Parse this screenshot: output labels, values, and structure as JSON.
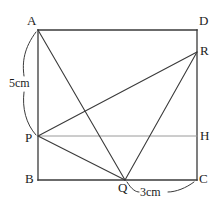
{
  "figure": {
    "type": "geometry-diagram",
    "stroke_color": "#3a3a3a",
    "light_stroke_color": "#9a9a9a",
    "background_color": "#ffffff",
    "canvas": {
      "width": 219,
      "height": 210
    },
    "vertices": [
      {
        "id": "A",
        "label": "A",
        "x": 38,
        "y": 30,
        "label_x": 27,
        "label_y": 14
      },
      {
        "id": "D",
        "label": "D",
        "x": 197,
        "y": 30,
        "label_x": 199,
        "label_y": 14
      },
      {
        "id": "R",
        "label": "R",
        "x": 197,
        "y": 52,
        "label_x": 200,
        "label_y": 44
      },
      {
        "id": "H",
        "label": "H",
        "x": 197,
        "y": 136,
        "label_x": 200,
        "label_y": 128
      },
      {
        "id": "P",
        "label": "P",
        "x": 38,
        "y": 136,
        "label_x": 25,
        "label_y": 136
      },
      {
        "id": "B",
        "label": "B",
        "x": 38,
        "y": 180,
        "label_x": 25,
        "label_y": 176
      },
      {
        "id": "Q",
        "label": "Q",
        "x": 125,
        "y": 180,
        "label_x": 118,
        "label_y": 182
      },
      {
        "id": "C",
        "label": "C",
        "x": 197,
        "y": 180,
        "label_x": 199,
        "label_y": 176
      }
    ],
    "rectangle_sides": [
      {
        "name": "side-AD",
        "from": "A",
        "to": "D"
      },
      {
        "name": "side-DC",
        "from": "D",
        "to": "C"
      },
      {
        "name": "side-CB",
        "from": "C",
        "to": "B"
      },
      {
        "name": "side-BA",
        "from": "B",
        "to": "A"
      }
    ],
    "segments": [
      {
        "name": "segment-AQ",
        "from": "A",
        "to": "Q",
        "style": "dark"
      },
      {
        "name": "segment-PR",
        "from": "P",
        "to": "R",
        "style": "dark"
      },
      {
        "name": "segment-PQ",
        "from": "P",
        "to": "Q",
        "style": "dark"
      },
      {
        "name": "segment-QR",
        "from": "Q",
        "to": "R",
        "style": "dark"
      },
      {
        "name": "segment-PH",
        "from": "P",
        "to": "H",
        "style": "light"
      }
    ],
    "dimensions": [
      {
        "name": "dimension-AP",
        "text": "5cm",
        "measures": "A to P",
        "label_x": 9,
        "label_y": 77,
        "brace_side": "left"
      },
      {
        "name": "dimension-QC",
        "text": "3cm",
        "measures": "Q to C",
        "label_x": 140,
        "label_y": 186,
        "brace_side": "bottom"
      }
    ]
  }
}
